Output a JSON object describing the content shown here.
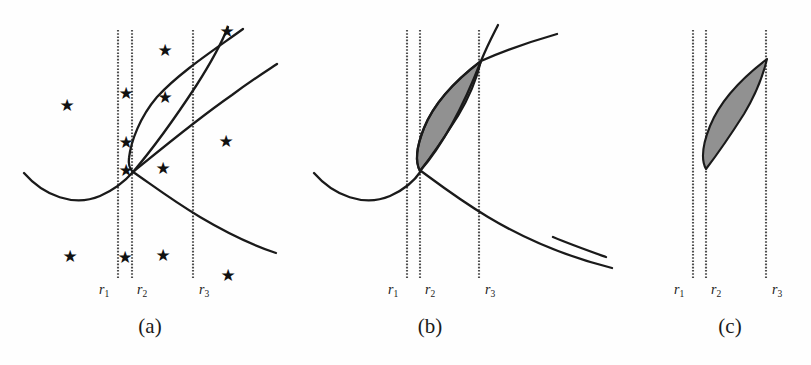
{
  "figure": {
    "width": 811,
    "height": 365,
    "background": "#fefefe",
    "ink_color": "#1a1a1a",
    "shade_color": "#8c8c8c",
    "dotted_line_color": "#555555",
    "star_glyph": "★"
  },
  "panels": [
    {
      "id": "a",
      "caption": "(a)",
      "caption_x": 150,
      "caption_y": 316,
      "has_stars": true,
      "has_shading": false,
      "axis_lines": [
        {
          "name": "r1",
          "x": 118,
          "y_top": 30,
          "y_bottom": 278
        },
        {
          "name": "r2",
          "x": 132,
          "y_top": 30,
          "y_bottom": 278
        },
        {
          "name": "r3",
          "x": 193,
          "y_top": 30,
          "y_bottom": 278
        }
      ],
      "axis_labels": [
        {
          "text": "r",
          "sub": "1",
          "x": 99,
          "y": 283
        },
        {
          "text": "r",
          "sub": "2",
          "x": 137,
          "y": 283
        },
        {
          "text": "r",
          "sub": "3",
          "x": 199,
          "y": 283
        }
      ],
      "stars": [
        {
          "x": 165,
          "y": 50
        },
        {
          "x": 227,
          "y": 31
        },
        {
          "x": 126,
          "y": 93
        },
        {
          "x": 67,
          "y": 105
        },
        {
          "x": 165,
          "y": 97
        },
        {
          "x": 126,
          "y": 142
        },
        {
          "x": 226,
          "y": 141
        },
        {
          "x": 126,
          "y": 170
        },
        {
          "x": 163,
          "y": 168
        },
        {
          "x": 70,
          "y": 256
        },
        {
          "x": 125,
          "y": 257
        },
        {
          "x": 163,
          "y": 255
        },
        {
          "x": 228,
          "y": 275
        }
      ]
    },
    {
      "id": "b",
      "caption": "(b)",
      "caption_x": 430,
      "caption_y": 316,
      "has_stars": false,
      "has_shading": true,
      "axis_lines": [
        {
          "name": "r1",
          "x": 407,
          "y_top": 30,
          "y_bottom": 278
        },
        {
          "name": "r2",
          "x": 420,
          "y_top": 30,
          "y_bottom": 278
        },
        {
          "name": "r3",
          "x": 479,
          "y_top": 30,
          "y_bottom": 278
        }
      ],
      "axis_labels": [
        {
          "text": "r",
          "sub": "1",
          "x": 388,
          "y": 283
        },
        {
          "text": "r",
          "sub": "2",
          "x": 425,
          "y": 283
        },
        {
          "text": "r",
          "sub": "3",
          "x": 485,
          "y": 283
        }
      ],
      "stars": []
    },
    {
      "id": "c",
      "caption": "(c)",
      "caption_x": 730,
      "caption_y": 316,
      "has_stars": false,
      "has_shading": true,
      "axis_lines": [
        {
          "name": "r1",
          "x": 693,
          "y_top": 30,
          "y_bottom": 278
        },
        {
          "name": "r2",
          "x": 706,
          "y_top": 30,
          "y_bottom": 278
        },
        {
          "name": "r3",
          "x": 766,
          "y_top": 30,
          "y_bottom": 278
        }
      ],
      "axis_labels": [
        {
          "text": "r",
          "sub": "1",
          "x": 674,
          "y": 283
        },
        {
          "text": "r",
          "sub": "2",
          "x": 711,
          "y": 283
        },
        {
          "text": "r",
          "sub": "3",
          "x": 772,
          "y": 283
        }
      ],
      "stars": []
    }
  ],
  "chart_data": {
    "type": "line",
    "title": "",
    "xlabel": "",
    "ylabel": "",
    "grid": false,
    "legend": null,
    "series": [
      {
        "name": "upper-curve-panel-a",
        "panel": "a",
        "kind": "parabola-branch",
        "path_points": [
          [
            225,
            27
          ],
          [
            205,
            44
          ],
          [
            180,
            66
          ],
          [
            158,
            90
          ],
          [
            140,
            117
          ],
          [
            131,
            142
          ],
          [
            129,
            160
          ],
          [
            131,
            170
          ]
        ]
      },
      {
        "name": "lower-curve-panel-a",
        "panel": "a",
        "kind": "descending-curve",
        "path_points": [
          [
            25,
            174
          ],
          [
            48,
            193
          ],
          [
            72,
            202
          ],
          [
            96,
            198
          ],
          [
            120,
            183
          ],
          [
            133,
            172
          ],
          [
            160,
            190
          ],
          [
            200,
            216
          ],
          [
            240,
            238
          ],
          [
            270,
            250
          ]
        ]
      },
      {
        "name": "rising-curve-panel-a",
        "panel": "a",
        "kind": "rising-curve",
        "path_points": [
          [
            133,
            172
          ],
          [
            160,
            150
          ],
          [
            190,
            120
          ],
          [
            210,
            95
          ],
          [
            230,
            64
          ],
          [
            245,
            38
          ],
          [
            255,
            20
          ]
        ]
      },
      {
        "name": "arc-curve-panel-a",
        "panel": "a",
        "kind": "concave-arc",
        "path_points": [
          [
            133,
            172
          ],
          [
            160,
            150
          ],
          [
            195,
            120
          ],
          [
            230,
            90
          ],
          [
            262,
            65
          ],
          [
            275,
            57
          ]
        ]
      },
      {
        "name": "upper-curve-panel-b",
        "panel": "b",
        "kind": "parabola-branch",
        "path_points": [
          [
            480,
            62
          ],
          [
            455,
            82
          ],
          [
            435,
            105
          ],
          [
            424,
            131
          ],
          [
            419,
            152
          ],
          [
            420,
            167
          ]
        ]
      },
      {
        "name": "lower-curve-panel-b",
        "panel": "b",
        "kind": "descending-curve",
        "path_points": [
          [
            314,
            174
          ],
          [
            338,
            193
          ],
          [
            362,
            202
          ],
          [
            386,
            198
          ],
          [
            410,
            183
          ],
          [
            421,
            170
          ],
          [
            448,
            189
          ],
          [
            488,
            216
          ],
          [
            530,
            238
          ],
          [
            560,
            250
          ],
          [
            600,
            262
          ],
          [
            640,
            272
          ]
        ]
      },
      {
        "name": "rising-line-panel-b",
        "panel": "b",
        "kind": "rising-line",
        "path_points": [
          [
            421,
            170
          ],
          [
            450,
            140
          ],
          [
            470,
            105
          ],
          [
            488,
            68
          ],
          [
            500,
            40
          ],
          [
            508,
            24
          ]
        ]
      },
      {
        "name": "arc-curve-panel-b",
        "panel": "b",
        "kind": "concave-arc",
        "path_points": [
          [
            421,
            170
          ],
          [
            455,
            140
          ],
          [
            492,
            107
          ],
          [
            530,
            80
          ],
          [
            565,
            58
          ],
          [
            580,
            50
          ]
        ]
      },
      {
        "name": "shaded-lens-panel-b",
        "panel": "b",
        "kind": "filled-region",
        "vertices": [
          [
            480,
            62
          ],
          [
            455,
            82
          ],
          [
            435,
            105
          ],
          [
            424,
            131
          ],
          [
            419,
            152
          ],
          [
            420,
            170
          ],
          [
            440,
            144
          ],
          [
            458,
            115
          ],
          [
            472,
            86
          ]
        ]
      },
      {
        "name": "shaded-lens-panel-c",
        "panel": "c",
        "kind": "filled-region",
        "vertices": [
          [
            766,
            60
          ],
          [
            740,
            82
          ],
          [
            720,
            106
          ],
          [
            709,
            132
          ],
          [
            704,
            153
          ],
          [
            705,
            168
          ],
          [
            725,
            142
          ],
          [
            744,
            112
          ],
          [
            758,
            83
          ]
        ]
      },
      {
        "name": "stub-line-panel-c",
        "panel": "c",
        "kind": "line-segment",
        "path_points": [
          [
            553,
            238
          ],
          [
            605,
            257
          ]
        ]
      }
    ]
  }
}
